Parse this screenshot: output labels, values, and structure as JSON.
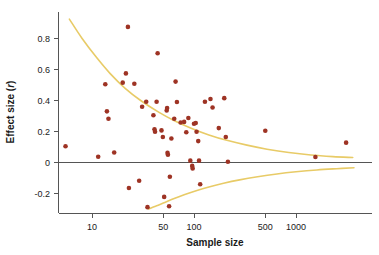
{
  "chart_data": {
    "type": "scatter",
    "title": "",
    "xlabel": "Sample size",
    "ylabel": "Effect size (r)",
    "x_scale": "log",
    "y_scale": "linear",
    "xlim": [
      4,
      4000
    ],
    "ylim": [
      -0.3,
      0.95
    ],
    "grid": false,
    "legend": null,
    "xticks": [
      10,
      50,
      100,
      500,
      1000
    ],
    "xtick_labels": [
      "10",
      "50",
      "100",
      "500",
      "1000"
    ],
    "yticks": [
      -0.2,
      0,
      0.2,
      0.4,
      0.6,
      0.8
    ],
    "ytick_labels": [
      "-0.2",
      "0",
      "0.2",
      "0.4",
      "0.6",
      "0.8"
    ],
    "point_color": "#9e3324",
    "curve_color": "#e8cb67",
    "axis_color": "#555555",
    "zero_reference_line": 0,
    "annotations": [
      "Funnel plot: upper and lower pseudo-confidence bounds converge toward r = 0 as sample size increases."
    ],
    "series": [
      {
        "name": "studies",
        "marker": "circle",
        "color": "#9e3324",
        "points": [
          {
            "x": 5.5,
            "y": 0.105
          },
          {
            "x": 11.5,
            "y": 0.037
          },
          {
            "x": 13.5,
            "y": 0.505
          },
          {
            "x": 14.0,
            "y": 0.33
          },
          {
            "x": 14.5,
            "y": 0.282
          },
          {
            "x": 16.5,
            "y": 0.065
          },
          {
            "x": 20.0,
            "y": 0.515
          },
          {
            "x": 21.5,
            "y": 0.575
          },
          {
            "x": 22.5,
            "y": 0.875
          },
          {
            "x": 23.0,
            "y": -0.165
          },
          {
            "x": 26.0,
            "y": 0.508
          },
          {
            "x": 29.0,
            "y": -0.118
          },
          {
            "x": 31.0,
            "y": 0.36
          },
          {
            "x": 34.0,
            "y": 0.392
          },
          {
            "x": 35.0,
            "y": -0.288
          },
          {
            "x": 40.0,
            "y": 0.305
          },
          {
            "x": 41.0,
            "y": 0.215
          },
          {
            "x": 41.5,
            "y": 0.198
          },
          {
            "x": 43.0,
            "y": 0.392
          },
          {
            "x": 44.0,
            "y": 0.705
          },
          {
            "x": 48.0,
            "y": 0.207
          },
          {
            "x": 49.5,
            "y": 0.165
          },
          {
            "x": 51.0,
            "y": -0.222
          },
          {
            "x": 54.0,
            "y": 0.335
          },
          {
            "x": 54.5,
            "y": 0.352
          },
          {
            "x": 55.0,
            "y": 0.062
          },
          {
            "x": 55.5,
            "y": 0.05
          },
          {
            "x": 57.0,
            "y": -0.282
          },
          {
            "x": 58.0,
            "y": -0.092
          },
          {
            "x": 60.0,
            "y": 0.155
          },
          {
            "x": 64.0,
            "y": 0.282
          },
          {
            "x": 66.0,
            "y": 0.522
          },
          {
            "x": 68.0,
            "y": 0.39
          },
          {
            "x": 74.0,
            "y": 0.258
          },
          {
            "x": 80.0,
            "y": 0.262
          },
          {
            "x": 84.0,
            "y": 0.195
          },
          {
            "x": 88.0,
            "y": 0.287
          },
          {
            "x": 92.0,
            "y": 0.012
          },
          {
            "x": 96.0,
            "y": -0.022
          },
          {
            "x": 97.0,
            "y": -0.038
          },
          {
            "x": 100.0,
            "y": 0.25
          },
          {
            "x": 104.0,
            "y": 0.255
          },
          {
            "x": 106.0,
            "y": 0.198
          },
          {
            "x": 110.0,
            "y": 0.138
          },
          {
            "x": 112.0,
            "y": 0.012
          },
          {
            "x": 115.0,
            "y": -0.14
          },
          {
            "x": 128.0,
            "y": 0.392
          },
          {
            "x": 145.0,
            "y": 0.41
          },
          {
            "x": 152.0,
            "y": 0.355
          },
          {
            "x": 175.0,
            "y": 0.222
          },
          {
            "x": 198.0,
            "y": 0.415
          },
          {
            "x": 205.0,
            "y": 0.165
          },
          {
            "x": 215.0,
            "y": 0.005
          },
          {
            "x": 500.0,
            "y": 0.205
          },
          {
            "x": 1550.0,
            "y": 0.035
          },
          {
            "x": 3100.0,
            "y": 0.128
          }
        ]
      }
    ],
    "curves": [
      {
        "name": "upper-funnel-bound",
        "color": "#e8cb67",
        "points": [
          {
            "x": 6.0,
            "y": 0.925
          },
          {
            "x": 8.0,
            "y": 0.8
          },
          {
            "x": 11.0,
            "y": 0.68
          },
          {
            "x": 15.0,
            "y": 0.575
          },
          {
            "x": 21.0,
            "y": 0.48
          },
          {
            "x": 30.0,
            "y": 0.4
          },
          {
            "x": 45.0,
            "y": 0.325
          },
          {
            "x": 65.0,
            "y": 0.268
          },
          {
            "x": 95.0,
            "y": 0.22
          },
          {
            "x": 140.0,
            "y": 0.178
          },
          {
            "x": 210.0,
            "y": 0.143
          },
          {
            "x": 330.0,
            "y": 0.112
          },
          {
            "x": 520.0,
            "y": 0.086
          },
          {
            "x": 850.0,
            "y": 0.064
          },
          {
            "x": 1400.0,
            "y": 0.048
          },
          {
            "x": 2300.0,
            "y": 0.038
          },
          {
            "x": 3600.0,
            "y": 0.032
          }
        ]
      },
      {
        "name": "lower-funnel-bound",
        "color": "#e8cb67",
        "points": [
          {
            "x": 36.0,
            "y": -0.3
          },
          {
            "x": 42.0,
            "y": -0.282
          },
          {
            "x": 50.0,
            "y": -0.262
          },
          {
            "x": 62.0,
            "y": -0.236
          },
          {
            "x": 80.0,
            "y": -0.208
          },
          {
            "x": 105.0,
            "y": -0.182
          },
          {
            "x": 140.0,
            "y": -0.158
          },
          {
            "x": 195.0,
            "y": -0.134
          },
          {
            "x": 280.0,
            "y": -0.112
          },
          {
            "x": 420.0,
            "y": -0.092
          },
          {
            "x": 650.0,
            "y": -0.074
          },
          {
            "x": 1000.0,
            "y": -0.06
          },
          {
            "x": 1600.0,
            "y": -0.048
          },
          {
            "x": 2500.0,
            "y": -0.04
          },
          {
            "x": 3700.0,
            "y": -0.034
          }
        ]
      }
    ]
  },
  "axes": {
    "x_title": "Sample size",
    "y_title_prefix": "Effect size (",
    "y_title_italic": "r",
    "y_title_suffix": ")"
  }
}
